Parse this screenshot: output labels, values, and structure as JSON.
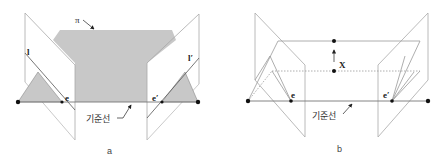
{
  "colors": {
    "plane_fill": "#c8c8c8",
    "line": "#9a9a9a",
    "dark_line": "#555555",
    "point": "#111111",
    "background": "#ffffff"
  },
  "diagram_a": {
    "caption": "a",
    "plane_label": "π",
    "left_epipolar_line_label": "l",
    "right_epipolar_line_label": "l′",
    "left_epipole_label": "e",
    "right_epipole_label": "e′",
    "baseline_label": "기준선"
  },
  "diagram_b": {
    "caption": "b",
    "point_label": "X",
    "left_epipole_label": "e",
    "right_epipole_label": "e′",
    "baseline_label": "기준선"
  }
}
